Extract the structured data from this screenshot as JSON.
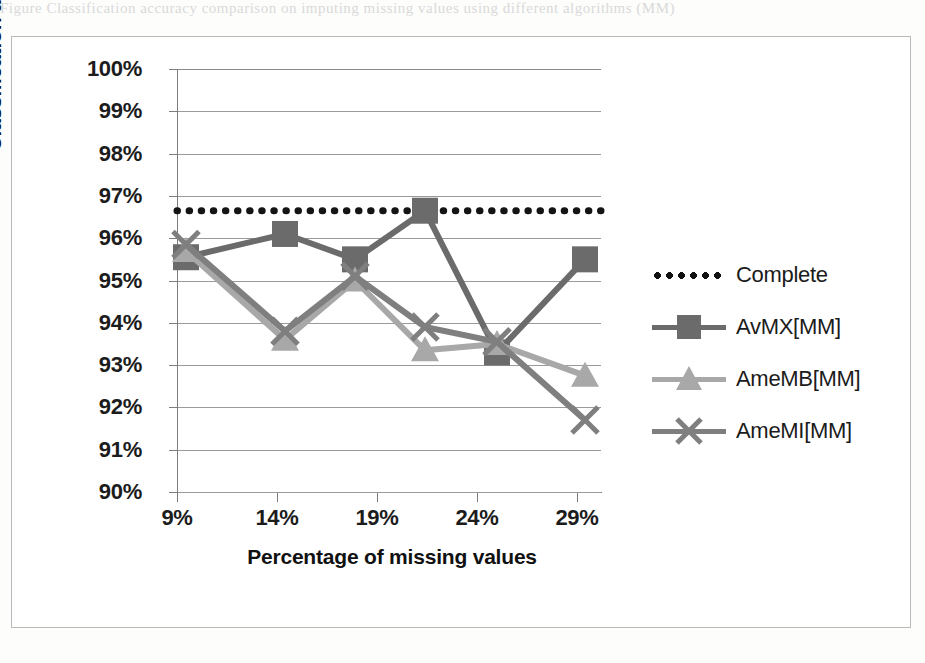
{
  "caption_sliver": "Figure   Classification accuracy comparison on imputing missing values using different algorithms (MM)",
  "chart": {
    "y_axis_title": "Classification accuracy",
    "x_axis_title": "Percentage of missing values"
  },
  "chart_data": {
    "type": "line",
    "title": "",
    "xlabel": "Percentage of missing values",
    "ylabel": "Classification accuracy",
    "xlim": [
      9,
      30
    ],
    "ylim": [
      90,
      100
    ],
    "xticks": [
      "9%",
      "14%",
      "19%",
      "24%",
      "29%"
    ],
    "xtick_values": [
      9,
      14,
      19,
      24,
      29
    ],
    "yticks": [
      "90%",
      "91%",
      "92%",
      "93%",
      "94%",
      "95%",
      "96%",
      "97%",
      "98%",
      "99%",
      "100%"
    ],
    "ytick_values": [
      90,
      91,
      92,
      93,
      94,
      95,
      96,
      97,
      98,
      99,
      100
    ],
    "grid": true,
    "legend_position": "right",
    "x": [
      9.45,
      14.4,
      17.9,
      21.4,
      25.0,
      29.4
    ],
    "series": [
      {
        "name": "Complete",
        "style": "dotted",
        "marker": "none",
        "color": "#141414",
        "constant_value": 96.65,
        "values": [
          96.65,
          96.65,
          96.65,
          96.65,
          96.65,
          96.65
        ]
      },
      {
        "name": "AvMX[MM]",
        "style": "solid",
        "marker": "square",
        "color": "#6b6b6b",
        "values": [
          95.55,
          96.1,
          95.5,
          96.65,
          93.3,
          95.5
        ]
      },
      {
        "name": "AmeMB[MM]",
        "style": "solid",
        "marker": "triangle",
        "color": "#a8a8a8",
        "values": [
          95.7,
          93.6,
          95.0,
          93.35,
          93.5,
          92.75
        ]
      },
      {
        "name": "AmeMI[MM]",
        "style": "solid",
        "marker": "x",
        "color": "#7f7f7f",
        "values": [
          95.85,
          93.8,
          95.1,
          93.9,
          93.55,
          91.7
        ]
      }
    ]
  }
}
